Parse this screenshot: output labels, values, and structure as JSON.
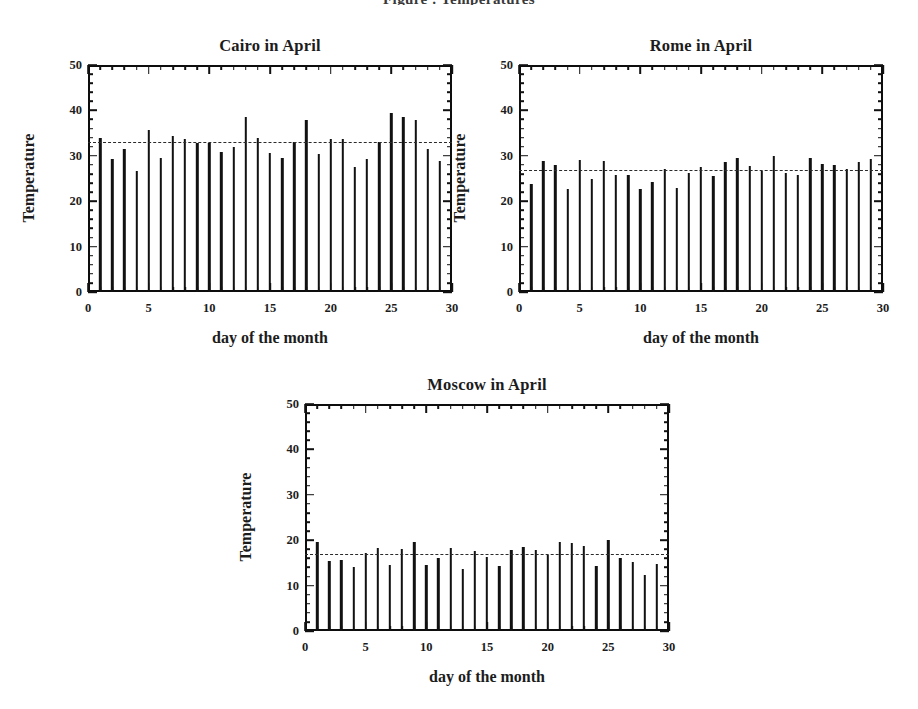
{
  "figure": {
    "top_caption_fragment": "Figure : Temperatures",
    "background_color": "#ffffff",
    "ink_color": "#111111"
  },
  "axis": {
    "y_title": "Temperature",
    "x_title": "day of the month",
    "y_ticks": [
      0,
      10,
      20,
      30,
      40,
      50
    ],
    "x_ticks": [
      0,
      5,
      10,
      15,
      20,
      25,
      30
    ],
    "ylim": [
      0,
      50
    ],
    "xlim": [
      0,
      30
    ],
    "grid": "off",
    "legend": "none"
  },
  "chart_data": [
    {
      "type": "bar",
      "title": "Cairo in April",
      "xlabel": "day of the month",
      "ylabel": "Temperature",
      "xlim": [
        0,
        30
      ],
      "ylim": [
        0,
        50
      ],
      "grid": false,
      "legend_position": "none",
      "mean_line": 32.8,
      "categories": [
        1,
        2,
        3,
        4,
        5,
        6,
        7,
        8,
        9,
        10,
        11,
        12,
        13,
        14,
        15,
        16,
        17,
        18,
        19,
        20,
        21,
        22,
        23,
        24,
        25,
        26,
        27,
        28,
        29
      ],
      "values": [
        34.0,
        29.2,
        31.5,
        26.7,
        35.7,
        29.6,
        34.4,
        33.8,
        32.8,
        32.8,
        30.9,
        32.0,
        38.6,
        34.0,
        30.7,
        29.5,
        33.0,
        37.9,
        30.4,
        33.8,
        33.6,
        27.5,
        29.3,
        33.0,
        39.4,
        38.5,
        37.8,
        31.6,
        28.8
      ]
    },
    {
      "type": "bar",
      "title": "Rome in April",
      "xlabel": "day of the month",
      "ylabel": "Temperature",
      "xlim": [
        0,
        30
      ],
      "ylim": [
        0,
        50
      ],
      "grid": false,
      "legend_position": "none",
      "mean_line": 26.7,
      "categories": [
        1,
        2,
        3,
        4,
        5,
        6,
        7,
        8,
        9,
        10,
        11,
        12,
        13,
        14,
        15,
        16,
        17,
        18,
        19,
        20,
        21,
        22,
        23,
        24,
        25,
        26,
        27,
        28,
        29
      ],
      "values": [
        23.9,
        28.9,
        28.0,
        22.8,
        29.0,
        25.0,
        28.9,
        25.8,
        25.7,
        22.7,
        24.3,
        27.1,
        23.0,
        26.2,
        27.5,
        25.5,
        28.7,
        29.6,
        27.7,
        26.7,
        29.9,
        26.3,
        25.8,
        29.6,
        28.2,
        28.0,
        27.2,
        28.6,
        29.4
      ]
    },
    {
      "type": "bar",
      "title": "Moscow in April",
      "xlabel": "day of the month",
      "ylabel": "Temperature",
      "xlim": [
        0,
        30
      ],
      "ylim": [
        0,
        50
      ],
      "grid": false,
      "legend_position": "none",
      "mean_line": 16.7,
      "categories": [
        1,
        2,
        3,
        4,
        5,
        6,
        7,
        8,
        9,
        10,
        11,
        12,
        13,
        14,
        15,
        16,
        17,
        18,
        19,
        20,
        21,
        22,
        23,
        24,
        25,
        26,
        27,
        28,
        29
      ],
      "values": [
        19.7,
        15.4,
        15.7,
        14.2,
        17.1,
        18.2,
        14.6,
        18.1,
        19.6,
        14.5,
        16.1,
        18.2,
        13.7,
        17.7,
        16.4,
        14.3,
        17.8,
        18.5,
        17.9,
        16.8,
        19.6,
        19.3,
        18.7,
        14.3,
        20.1,
        16.0,
        15.1,
        12.4,
        14.8
      ]
    }
  ],
  "panels": [
    {
      "name": "cairo",
      "title": "Cairo in April",
      "frame": {
        "left": 88,
        "top": 65,
        "width": 364,
        "height": 227
      },
      "title_top": 36
    },
    {
      "name": "rome",
      "title": "Rome in April",
      "frame": {
        "left": 519,
        "top": 65,
        "width": 364,
        "height": 227
      },
      "title_top": 36
    },
    {
      "name": "moscow",
      "title": "Moscow in April",
      "frame": {
        "left": 305,
        "top": 404,
        "width": 364,
        "height": 227
      },
      "title_top": 375
    }
  ]
}
